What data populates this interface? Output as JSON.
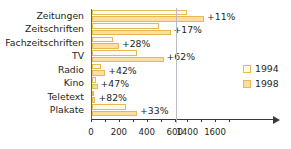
{
  "chart_data": {
    "type": "bar",
    "orientation": "horizontal",
    "title": "",
    "xlabel": "",
    "ylabel": "",
    "grid": false,
    "legend_position": "right",
    "axis_break": {
      "after": 600,
      "before": 1400
    },
    "xticks": [
      0,
      200,
      400,
      600,
      1400,
      1600
    ],
    "xtick_labels": [
      "0",
      "200",
      "400",
      "600",
      "1400",
      "1600"
    ],
    "xlim": [
      0,
      1800
    ],
    "categories": [
      "Zeitungen",
      "Zeitschriften",
      "Fachzeitschriften",
      "TV",
      "Radio",
      "Kino",
      "Teletext",
      "Plakate"
    ],
    "series": [
      {
        "name": "1994",
        "color": "#fefaef",
        "values": [
          1390,
          480,
          150,
          320,
          65,
          25,
          12,
          240
        ]
      },
      {
        "name": "1998",
        "color": "#fbdf9e",
        "values": [
          1510,
          560,
          190,
          510,
          92,
          37,
          22,
          320
        ]
      }
    ],
    "annotations": [
      "+11%",
      "+17%",
      "+28%",
      "+62%",
      "+42%",
      "+47%",
      "+82%",
      "+33%"
    ]
  },
  "legend": {
    "items": [
      {
        "label": "1994",
        "swatch": "y1994"
      },
      {
        "label": "1998",
        "swatch": "y1998"
      }
    ]
  },
  "colors": {
    "bar_1994": "#fefaef",
    "bar_1998": "#fbdf9e",
    "bar_border": "#e8b953",
    "axis": "#3a3a3a",
    "category_axis": "#6e6259",
    "break_line": "#b9bcc0",
    "text": "#231f20",
    "background": "#ffffff"
  }
}
